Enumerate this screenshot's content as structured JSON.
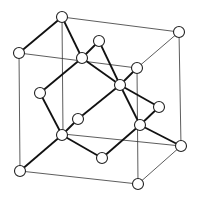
{
  "diagram": {
    "colors": {
      "background": "#ffffff",
      "line": "#111111",
      "atom_fill": "#ffffff",
      "atom_stroke": "#222222"
    },
    "atom_radius": 5.5,
    "nodes": [
      {
        "id": "corner-top-back-left",
        "x": 62,
        "y": 17
      },
      {
        "id": "corner-top-back-right",
        "x": 179,
        "y": 32
      },
      {
        "id": "corner-top-front-left",
        "x": 19,
        "y": 53
      },
      {
        "id": "corner-top-front-right",
        "x": 137,
        "y": 68
      },
      {
        "id": "corner-bottom-back-left",
        "x": 63,
        "y": 134
      },
      {
        "id": "corner-bottom-back-right",
        "x": 181,
        "y": 146
      },
      {
        "id": "corner-bottom-front-left",
        "x": 20,
        "y": 171
      },
      {
        "id": "corner-bottom-front-right",
        "x": 138,
        "y": 184
      },
      {
        "id": "face-top",
        "x": 99,
        "y": 41
      },
      {
        "id": "face-left",
        "x": 40,
        "y": 93
      },
      {
        "id": "face-front",
        "x": 78,
        "y": 119
      },
      {
        "id": "face-right",
        "x": 159,
        "y": 107
      },
      {
        "id": "face-bottom",
        "x": 102,
        "y": 158
      },
      {
        "id": "interior-1",
        "x": 82,
        "y": 58
      },
      {
        "id": "interior-2",
        "x": 120,
        "y": 85
      },
      {
        "id": "interior-3",
        "x": 62,
        "y": 135
      },
      {
        "id": "interior-4",
        "x": 140,
        "y": 125
      }
    ],
    "cube_edges": [
      [
        "corner-top-back-left",
        "corner-top-back-right"
      ],
      [
        "corner-top-front-left",
        "corner-top-front-right"
      ],
      [
        "corner-top-back-right",
        "corner-top-front-right"
      ],
      [
        "corner-top-front-left",
        "corner-bottom-front-left"
      ],
      [
        "corner-top-front-right",
        "corner-bottom-front-right"
      ],
      [
        "corner-top-back-right",
        "corner-bottom-back-right"
      ],
      [
        "corner-top-back-left",
        "corner-bottom-back-left"
      ],
      [
        "corner-bottom-front-left",
        "corner-bottom-front-right"
      ],
      [
        "corner-bottom-front-right",
        "corner-bottom-back-right"
      ],
      [
        "corner-bottom-back-left",
        "corner-bottom-back-right"
      ]
    ],
    "bonds": [
      [
        "corner-top-back-left",
        "corner-top-front-left"
      ],
      [
        "corner-top-back-left",
        "interior-1"
      ],
      [
        "interior-1",
        "face-top"
      ],
      [
        "interior-1",
        "face-left"
      ],
      [
        "interior-1",
        "interior-2"
      ],
      [
        "face-top",
        "interior-2"
      ],
      [
        "interior-2",
        "corner-top-front-right"
      ],
      [
        "interior-2",
        "face-front"
      ],
      [
        "interior-2",
        "interior-4"
      ],
      [
        "interior-2",
        "face-right"
      ],
      [
        "face-left",
        "interior-3"
      ],
      [
        "face-front",
        "interior-3"
      ],
      [
        "interior-3",
        "corner-bottom-front-left"
      ],
      [
        "interior-3",
        "face-bottom"
      ],
      [
        "face-right",
        "interior-4"
      ],
      [
        "interior-4",
        "corner-bottom-back-right"
      ],
      [
        "interior-4",
        "face-bottom"
      ]
    ]
  }
}
